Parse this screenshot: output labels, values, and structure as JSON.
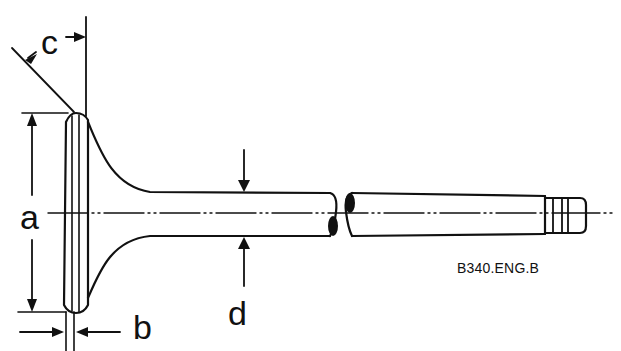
{
  "diagram": {
    "labels": {
      "a": "a",
      "b": "b",
      "c": "c",
      "d": "d"
    },
    "reference_code": "B340.ENG.B",
    "colors": {
      "line": "#111111",
      "background": "#ffffff"
    }
  }
}
